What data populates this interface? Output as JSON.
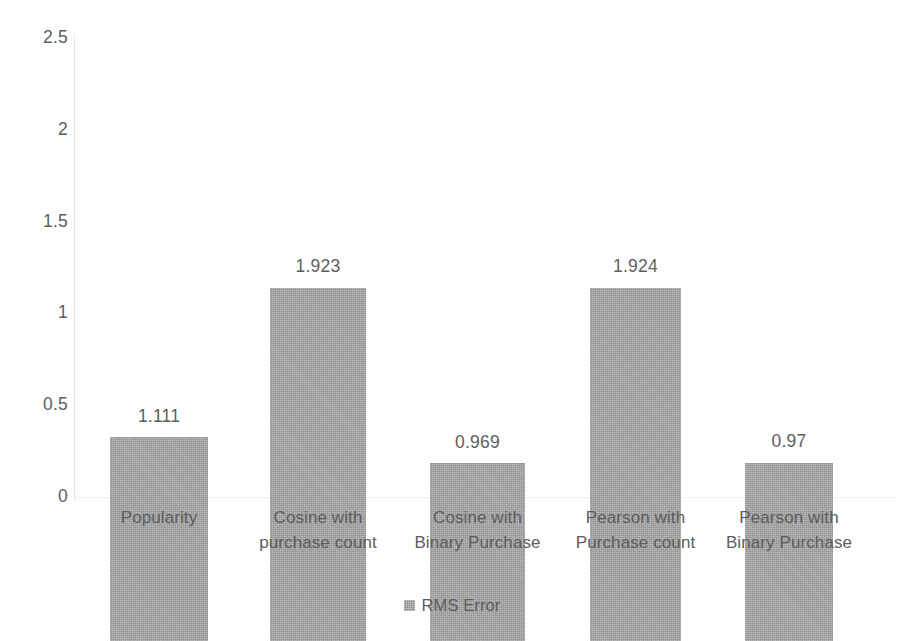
{
  "chart_data": {
    "type": "bar",
    "title": "",
    "subtitle": "",
    "xlabel": "",
    "ylabel": "",
    "categories": [
      "Popularity",
      "Cosine with purchase count",
      "Cosine with Binary Purchase",
      "Pearson with Purchase count",
      "Pearson with Binary Purchase"
    ],
    "category_lines": [
      [
        "Popularity",
        ""
      ],
      [
        "Cosine with",
        "purchase count"
      ],
      [
        "Cosine with",
        "Binary Purchase"
      ],
      [
        "Pearson with",
        "Purchase count"
      ],
      [
        "Pearson with",
        "Binary Purchase"
      ]
    ],
    "series": [
      {
        "name": "RMS Error",
        "values": [
          1.111,
          1.923,
          0.969,
          1.924,
          0.97
        ],
        "value_labels": [
          "1.111",
          "1.923",
          "0.969",
          "1.924",
          "0.97"
        ],
        "color": "#a6a6a6"
      }
    ],
    "ylim": [
      0,
      2.5
    ],
    "yticks": [
      0,
      0.5,
      1,
      1.5,
      2,
      2.5
    ],
    "ytick_labels": [
      "0",
      "0.5",
      "1",
      "1.5",
      "2",
      "2.5"
    ],
    "grid": false,
    "legend_position": "bottom",
    "data_labels_shown": true,
    "bar_color": "#a6a6a6",
    "text_color": "#5d5d5d",
    "background_color": "#ffffff"
  },
  "axis": {
    "y_tick_labels": [
      "2.5",
      "2",
      "1.5",
      "1",
      "0.5",
      "0"
    ]
  },
  "legend": {
    "items": [
      {
        "label": "RMS Error",
        "color": "#a6a6a6",
        "marker": "square-swatch-icon"
      }
    ]
  }
}
